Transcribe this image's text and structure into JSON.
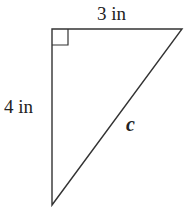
{
  "diagram": {
    "type": "right-triangle",
    "labels": {
      "top_side": "3 in",
      "left_side": "4 in",
      "hypotenuse": "c"
    },
    "right_angle_marker": true,
    "stroke_color": "#333333"
  }
}
